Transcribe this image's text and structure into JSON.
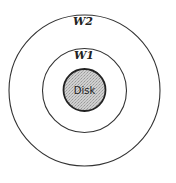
{
  "diagram": {
    "outer_region": {
      "label": "W2",
      "stroke": "#333333"
    },
    "inner_region": {
      "label": "W1",
      "stroke": "#333333"
    },
    "disk": {
      "label": "Disk",
      "fill": "#c4c4c4",
      "stroke": "#222222"
    }
  }
}
